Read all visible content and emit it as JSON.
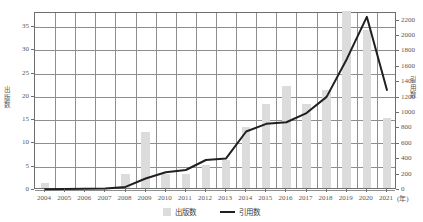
{
  "chart_data": {
    "type": "bar",
    "title": "",
    "xlabel": "(年)",
    "ylabel": "出版数",
    "y2label": "引用数",
    "categories": [
      "2004",
      "2005",
      "2006",
      "2007",
      "2008",
      "2009",
      "2010",
      "2011",
      "2012",
      "2013",
      "2014",
      "2015",
      "2016",
      "2017",
      "2018",
      "2019",
      "2020",
      "2021"
    ],
    "ylim": [
      0,
      38
    ],
    "y2lim": [
      0,
      2300
    ],
    "yticks": [
      0,
      5,
      10,
      15,
      20,
      25,
      30,
      35
    ],
    "y2ticks": [
      0,
      200,
      400,
      600,
      800,
      1000,
      1200,
      1400,
      1600,
      1800,
      2000,
      2200
    ],
    "grid": true,
    "legend_position": "bottom-center",
    "series": [
      {
        "name": "出版数",
        "type": "bar",
        "axis": "left",
        "color": "#dcdcdc",
        "values": [
          1,
          0,
          0,
          0,
          3,
          12,
          3,
          3,
          5,
          6,
          13,
          18,
          22,
          18,
          21,
          38,
          34,
          15
        ]
      },
      {
        "name": "引用数",
        "type": "line",
        "axis": "right",
        "color": "#231f20",
        "values": [
          10,
          12,
          15,
          20,
          40,
          150,
          230,
          260,
          390,
          410,
          760,
          860,
          880,
          1000,
          1210,
          1700,
          2250,
          1300
        ]
      }
    ]
  },
  "axis": {
    "left_title": "出版数",
    "right_title": "引用数",
    "x_unit": "(年)"
  },
  "legend": {
    "items": [
      {
        "label": "出版数",
        "marker": "bar-swatch-icon"
      },
      {
        "label": "引用数",
        "marker": "line-swatch-icon"
      }
    ]
  },
  "colors": {
    "bar": "#dcdcdc",
    "line": "#231f20",
    "grid": "#8d8e90",
    "axis": "#6d6e70",
    "text": "#58585a"
  }
}
